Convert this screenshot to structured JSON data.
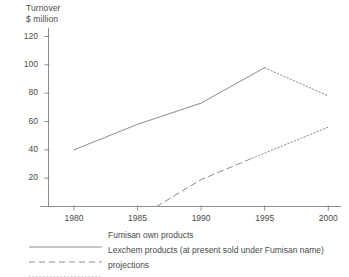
{
  "chart_data": {
    "type": "line",
    "title": "",
    "ylabel_line1": "Turnover",
    "ylabel_line2": "$ million",
    "xlabel": "",
    "xlim": [
      1978,
      2001
    ],
    "ylim": [
      0,
      126
    ],
    "grid": false,
    "legend_position": "below",
    "xticks": [
      "1980",
      "1985",
      "1990",
      "1995",
      "2000"
    ],
    "xtick_values": [
      1980,
      1985,
      1990,
      1995,
      2000
    ],
    "yticks": [
      "20",
      "40",
      "60",
      "80",
      "100",
      "120"
    ],
    "ytick_values": [
      20,
      40,
      60,
      80,
      100,
      120
    ],
    "series": [
      {
        "name": "Fumisan own products",
        "style": "solid",
        "x": [
          1980,
          1985,
          1990,
          1995
        ],
        "values": [
          40,
          58,
          73,
          98
        ]
      },
      {
        "name": "Fumisan own products (projection)",
        "style": "dotted",
        "x": [
          1995,
          2000
        ],
        "values": [
          98,
          78
        ]
      },
      {
        "name": "Lexchem products (at present sold under Fumisan name)",
        "style": "dashed",
        "x": [
          1986.5,
          1990,
          1994
        ],
        "values": [
          0,
          19,
          34
        ]
      },
      {
        "name": "Lexchem products (projection)",
        "style": "dotted",
        "x": [
          1994,
          2000
        ],
        "values": [
          34,
          56
        ]
      }
    ]
  },
  "legend": {
    "items": [
      {
        "label": "Fumisan own products",
        "style": "solid"
      },
      {
        "label": "Lexchem products (at present sold under Fumisan name)",
        "style": "dashed"
      },
      {
        "label": "projections",
        "style": "dotted"
      }
    ]
  }
}
